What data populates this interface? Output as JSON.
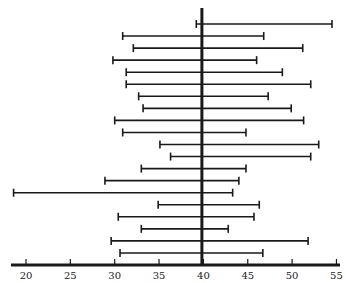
{
  "chart_data": {
    "type": "interval",
    "title": "",
    "xlabel": "",
    "ylabel": "",
    "xlim": [
      18.3,
      55.2
    ],
    "x_ticks": [
      20,
      25,
      30,
      35,
      40,
      45,
      50,
      55
    ],
    "x_tick_labels": [
      "20",
      "25",
      "30",
      "35",
      "40",
      "45",
      "50",
      "55"
    ],
    "reference_line": 40,
    "grid": false,
    "legend": null,
    "intervals": [
      {
        "low": 39.2,
        "high": 54.5
      },
      {
        "low": 30.9,
        "high": 46.8
      },
      {
        "low": 32.1,
        "high": 51.2
      },
      {
        "low": 29.8,
        "high": 46.0
      },
      {
        "low": 31.3,
        "high": 48.9
      },
      {
        "low": 31.3,
        "high": 52.1
      },
      {
        "low": 32.7,
        "high": 47.3
      },
      {
        "low": 33.2,
        "high": 49.9
      },
      {
        "low": 30.0,
        "high": 51.3
      },
      {
        "low": 30.9,
        "high": 44.8
      },
      {
        "low": 35.1,
        "high": 53.0
      },
      {
        "low": 36.3,
        "high": 52.1
      },
      {
        "low": 33.0,
        "high": 44.8
      },
      {
        "low": 28.9,
        "high": 44.0
      },
      {
        "low": 18.6,
        "high": 43.3
      },
      {
        "low": 34.9,
        "high": 46.3
      },
      {
        "low": 30.4,
        "high": 45.7
      },
      {
        "low": 33.0,
        "high": 42.8
      },
      {
        "low": 29.6,
        "high": 51.8
      },
      {
        "low": 30.6,
        "high": 46.7
      }
    ]
  },
  "colors": {
    "line": "#1a1a1a",
    "background": "#ffffff"
  }
}
